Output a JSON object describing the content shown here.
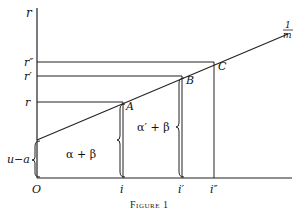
{
  "figure": {
    "caption_prefix": "Figure",
    "caption_number": "1",
    "y_axis_label": "r",
    "origin_label": "O",
    "line_label_numerator": "1",
    "line_label_denominator": "m",
    "y_ticks": [
      {
        "id": "r",
        "label": "r"
      },
      {
        "id": "r1",
        "label": "r′"
      },
      {
        "id": "r2",
        "label": "r″"
      }
    ],
    "x_ticks": [
      {
        "id": "i",
        "label": "i"
      },
      {
        "id": "i1",
        "label": "i′"
      },
      {
        "id": "i2",
        "label": "i″"
      }
    ],
    "points": [
      {
        "id": "A",
        "label": "A"
      },
      {
        "id": "B",
        "label": "B"
      },
      {
        "id": "C",
        "label": "C"
      }
    ],
    "intercept_label": "u−a",
    "region_labels": [
      {
        "id": "alpha-beta",
        "label": "α + β"
      },
      {
        "id": "alpha-prime-beta",
        "label": "α′ + β"
      }
    ]
  }
}
